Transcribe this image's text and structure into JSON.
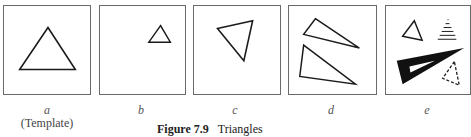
{
  "figure": {
    "caption_number": "Figure 7.9",
    "caption_text": "Triangles",
    "panels": [
      {
        "id": "a",
        "label": "a",
        "sublabel": "(Template)",
        "content": "single equilateral triangle, centered, outline"
      },
      {
        "id": "b",
        "label": "b",
        "sublabel": "",
        "content": "small triangle, upper right, outline"
      },
      {
        "id": "c",
        "label": "c",
        "sublabel": "",
        "content": "rotated triangle, outline"
      },
      {
        "id": "d",
        "label": "d",
        "sublabel": "",
        "content": "two elongated scalene triangles, outline"
      },
      {
        "id": "e",
        "label": "e",
        "sublabel": "",
        "content": "small outline triangle, hatched triangle, thick filled triangle, dashed triangle"
      }
    ]
  },
  "colors": {
    "stroke": "#1a1a1a",
    "border": "#6a6a6a",
    "background": "#ffffff"
  }
}
